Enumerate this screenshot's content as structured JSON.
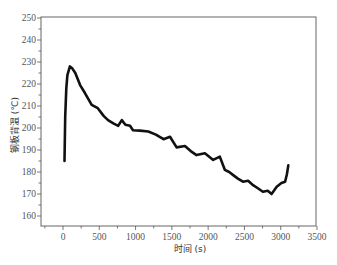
{
  "chart_data": {
    "type": "line",
    "title": "",
    "xlabel": "时间 (s)",
    "ylabel": "钢板背温 (℃)",
    "xlim": [
      -300,
      3500
    ],
    "ylim": [
      155.5,
      250
    ],
    "x_ticks": [
      0,
      500,
      1000,
      1500,
      2000,
      2500,
      3000,
      3500
    ],
    "y_ticks": [
      160,
      170,
      180,
      190,
      200,
      210,
      220,
      230,
      240,
      250
    ],
    "grid": false,
    "legend": null,
    "series": [
      {
        "name": "钢板背温",
        "color": "#111111",
        "x": [
          20,
          30,
          45,
          60,
          95,
          130,
          170,
          235,
          300,
          395,
          480,
          560,
          620,
          700,
          760,
          810,
          860,
          923,
          965,
          1060,
          1175,
          1280,
          1385,
          1475,
          1565,
          1680,
          1760,
          1840,
          1955,
          2070,
          2160,
          2230,
          2290,
          2345,
          2410,
          2480,
          2550,
          2620,
          2690,
          2755,
          2820,
          2875,
          2945,
          3010,
          3060,
          3085,
          3105
        ],
        "y": [
          185,
          205,
          218,
          224,
          228,
          227,
          225,
          219.5,
          216,
          210.5,
          209,
          205.5,
          203.6,
          202,
          201,
          203.6,
          201.5,
          201,
          199,
          198.8,
          198.4,
          197,
          194.9,
          196,
          191.2,
          191.8,
          189.5,
          187.7,
          188.5,
          185.5,
          187,
          181,
          180,
          178.6,
          177,
          175.6,
          176,
          174,
          172.5,
          171,
          171.5,
          170,
          173.3,
          175,
          175.6,
          179,
          183
        ]
      }
    ]
  }
}
